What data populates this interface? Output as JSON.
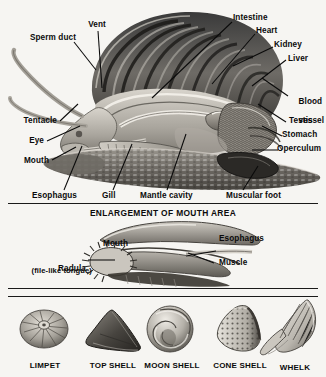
{
  "figure": {
    "type": "anatomical-diagram",
    "background_color": "#f6f5f2",
    "ink_color": "#0b0b0b",
    "panels": [
      {
        "id": "main",
        "title": "",
        "caption": "Cutaway side view of a snail showing internal organs"
      },
      {
        "id": "mouth",
        "title": "ENLARGEMENT OF MOUTH AREA"
      },
      {
        "id": "specimens",
        "title": ""
      }
    ]
  },
  "main_panel": {
    "labels_left": [
      {
        "id": "sperm-duct",
        "text": "Sperm duct"
      },
      {
        "id": "vent",
        "text": "Vent"
      },
      {
        "id": "tentacle",
        "text": "Tentacle"
      },
      {
        "id": "eye",
        "text": "Eye"
      },
      {
        "id": "mouth",
        "text": "Mouth"
      }
    ],
    "labels_right": [
      {
        "id": "intestine",
        "text": "Intestine"
      },
      {
        "id": "heart",
        "text": "Heart"
      },
      {
        "id": "kidney",
        "text": "Kidney"
      },
      {
        "id": "liver",
        "text": "Liver"
      },
      {
        "id": "blood-vessel",
        "text": "Blood",
        "text2": "vessel"
      },
      {
        "id": "testis",
        "text": "Testis"
      },
      {
        "id": "stomach",
        "text": "Stomach"
      },
      {
        "id": "operculum",
        "text": "Operculum"
      }
    ],
    "labels_bottom": [
      {
        "id": "esophagus",
        "text": "Esophagus"
      },
      {
        "id": "gill",
        "text": "Gill"
      },
      {
        "id": "mantle-cavity",
        "text": "Mantle cavity"
      },
      {
        "id": "muscular-foot",
        "text": "Muscular foot"
      }
    ]
  },
  "mouth_panel": {
    "title": "ENLARGEMENT OF MOUTH AREA",
    "labels": [
      {
        "id": "mouth",
        "text": "Mouth"
      },
      {
        "id": "esophagus",
        "text": "Esophagus"
      },
      {
        "id": "muscle",
        "text": "Muscle"
      },
      {
        "id": "radula",
        "text": "Radula",
        "text2": "(file-like tongue)"
      }
    ]
  },
  "specimens": {
    "items": [
      {
        "id": "limpet",
        "name": "LIMPET"
      },
      {
        "id": "top-shell",
        "name": "TOP SHELL"
      },
      {
        "id": "moon-shell",
        "name": "MOON SHELL"
      },
      {
        "id": "cone-shell",
        "name": "CONE SHELL"
      },
      {
        "id": "whelk",
        "name": "WHELK"
      }
    ]
  }
}
